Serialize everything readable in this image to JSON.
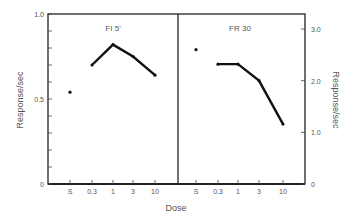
{
  "chart_data": [
    {
      "type": "line",
      "title": "FI 5'",
      "xlabel": "Dose",
      "ylabel": "Response/sec",
      "categories": [
        "S",
        "0.3",
        "1",
        "3",
        "10"
      ],
      "series": [
        {
          "name": "FI 5'",
          "values": [
            0.54,
            0.7,
            0.82,
            0.75,
            0.64
          ],
          "connected_from_index": 1
        }
      ],
      "ylim": [
        0,
        1.0
      ],
      "yticks": [
        "0",
        "0.5",
        "1.0"
      ],
      "grid": false
    },
    {
      "type": "line",
      "title": "FR 30",
      "xlabel": "Dose",
      "ylabel": "Response/sec",
      "categories": [
        "S",
        "0.3",
        "1",
        "3",
        "10"
      ],
      "series": [
        {
          "name": "FR 30",
          "values": [
            2.6,
            2.32,
            2.32,
            2.0,
            1.16
          ],
          "connected_from_index": 1
        }
      ],
      "ylim": [
        0,
        3.0
      ],
      "yticks": [
        "0",
        "1.0",
        "2.0",
        "3.0"
      ],
      "grid": false
    }
  ],
  "labels": {
    "left_panel_title": "FI 5'",
    "right_panel_title": "FR 30",
    "x_axis_label": "Dose",
    "left_y_label": "Response/sec",
    "right_y_label": "Response/sec",
    "left_yticks": [
      "1.0",
      "0.5",
      "0"
    ],
    "right_yticks": [
      "3.0",
      "2.0",
      "1.0",
      "0"
    ],
    "xticks": [
      "S",
      "0.3",
      "1",
      "3",
      "10"
    ]
  }
}
